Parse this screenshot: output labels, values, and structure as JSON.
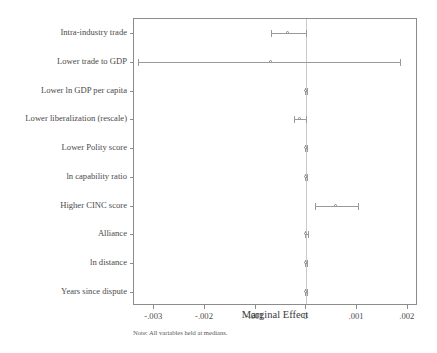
{
  "chart_data": {
    "type": "scatter",
    "title": "",
    "subtitle": "",
    "xlabel": "Marginal Effect",
    "ylabel": "",
    "note": "Note: All variables held at medians.",
    "orientation": "horizontal",
    "grid": false,
    "legend": null,
    "zero_reference_line": true,
    "xlim": [
      -0.0034,
      0.0022
    ],
    "xticks": [
      -0.003,
      -0.002,
      -0.001,
      0,
      0.001,
      0.002
    ],
    "xticklabels": [
      "-.003",
      "-.002",
      "-.001",
      "0",
      ".001",
      ".002"
    ],
    "categories": [
      "Intra-industry trade",
      "Lower trade to GDP",
      "Lower ln GDP per capita",
      "Lower liberalization (rescale)",
      "Lower Polity score",
      "ln capability ratio",
      "Higher CINC score",
      "Alliance",
      "ln distance",
      "Years since dispute"
    ],
    "series": [
      {
        "name": "Marginal effect with 95% confidence interval",
        "points": [
          {
            "category": "Intra-industry trade",
            "estimate": -0.00037,
            "ci_low": -0.00069,
            "ci_high": 0.0
          },
          {
            "category": "Lower trade to GDP",
            "estimate": -0.0007,
            "ci_low": -0.00333,
            "ci_high": 0.00185
          },
          {
            "category": "Lower ln GDP per capita",
            "estimate": 0.0,
            "ci_low": -2e-05,
            "ci_high": 2e-05
          },
          {
            "category": "Lower liberalization (rescale)",
            "estimate": -0.00012,
            "ci_low": -0.00024,
            "ci_high": 0.0
          },
          {
            "category": "Lower Polity score",
            "estimate": 0.0,
            "ci_low": -2e-05,
            "ci_high": 2e-05
          },
          {
            "category": "ln capability ratio",
            "estimate": 0.0,
            "ci_low": -2e-05,
            "ci_high": 2e-05
          },
          {
            "category": "Higher CINC score",
            "estimate": 0.00058,
            "ci_low": 0.00016,
            "ci_high": 0.00101
          },
          {
            "category": "Alliance",
            "estimate": 0.0,
            "ci_low": -3e-05,
            "ci_high": 3e-05
          },
          {
            "category": "ln distance",
            "estimate": 0.0,
            "ci_low": -2e-05,
            "ci_high": 2e-05
          },
          {
            "category": "Years since dispute",
            "estimate": 0.0,
            "ci_low": -2e-05,
            "ci_high": 2e-05
          }
        ]
      }
    ],
    "colors": {
      "frame": "#8c8c8c",
      "interval": "#9a9a9a",
      "marker_edge": "#8a8a8a",
      "marker_fill": "#ffffff",
      "zero_line": "#c9c9c9",
      "text": "#3a3a3a",
      "background": "#ffffff"
    }
  }
}
